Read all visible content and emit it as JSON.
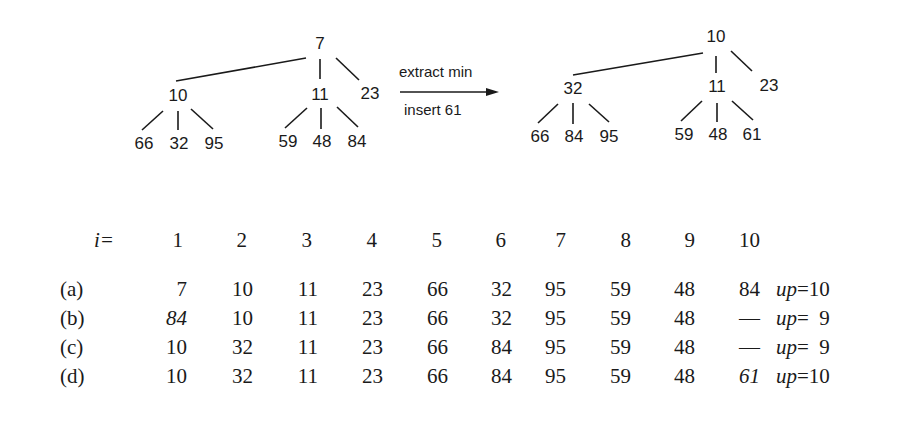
{
  "left_tree": {
    "root": "7",
    "children": [
      {
        "value": "10",
        "children": [
          "66",
          "32",
          "95"
        ]
      },
      {
        "value": "11",
        "children": [
          "59",
          "48",
          "84"
        ]
      },
      {
        "value": "23",
        "children": []
      }
    ]
  },
  "operation": {
    "line1": "extract min",
    "line2": "insert 61"
  },
  "right_tree": {
    "root": "10",
    "children": [
      {
        "value": "32",
        "children": [
          "66",
          "84",
          "95"
        ]
      },
      {
        "value": "11",
        "children": [
          "59",
          "48",
          "61"
        ]
      },
      {
        "value": "23",
        "children": []
      }
    ]
  },
  "table": {
    "index_label": "i=",
    "indices": [
      "1",
      "2",
      "3",
      "4",
      "5",
      "6",
      "7",
      "8",
      "9",
      "10"
    ],
    "rows": [
      {
        "label": "(a)",
        "values": [
          "7",
          "10",
          "11",
          "23",
          "66",
          "32",
          "95",
          "59",
          "48",
          "84"
        ],
        "up_label": "up",
        "up_value": "=10"
      },
      {
        "label": "(b)",
        "values": [
          "84",
          "10",
          "11",
          "23",
          "66",
          "32",
          "95",
          "59",
          "48",
          "—"
        ],
        "up_label": "up",
        "up_value": "=  9"
      },
      {
        "label": "(c)",
        "values": [
          "10",
          "32",
          "11",
          "23",
          "66",
          "84",
          "95",
          "59",
          "48",
          "—"
        ],
        "up_label": "up",
        "up_value": "=  9"
      },
      {
        "label": "(d)",
        "values": [
          "10",
          "32",
          "11",
          "23",
          "66",
          "84",
          "95",
          "59",
          "48",
          "61"
        ],
        "up_label": "up",
        "up_value": "=10"
      }
    ]
  }
}
